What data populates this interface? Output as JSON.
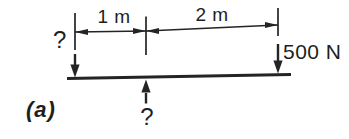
{
  "diagram": {
    "kind": "beam-free-body-diagram",
    "caption": "(a)",
    "dimensions": [
      {
        "name": "left-span",
        "label": "1 m"
      },
      {
        "name": "right-span",
        "label": "2 m"
      }
    ],
    "forces": [
      {
        "name": "left-reaction",
        "label": "?",
        "direction": "down"
      },
      {
        "name": "applied-load",
        "label": "500 N",
        "direction": "down"
      },
      {
        "name": "support-reaction",
        "label": "?",
        "direction": "up"
      }
    ],
    "colors": {
      "ink": "#242424",
      "background": "#ffffff"
    }
  }
}
